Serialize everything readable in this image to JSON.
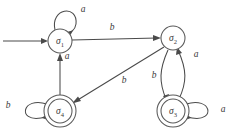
{
  "diagram": {
    "type": "finite-state-automaton",
    "title": "",
    "stroke_color": "#4a4a4a",
    "label_color": "#3a3a3a",
    "background": "#ffffff",
    "alphabet": [
      "a",
      "b"
    ],
    "states": [
      {
        "id": "s1",
        "label": "σ",
        "subscript": "1",
        "x": 60,
        "y": 41,
        "radius": 12,
        "accepting": false,
        "initial": true
      },
      {
        "id": "s2",
        "label": "σ",
        "subscript": "2",
        "x": 173,
        "y": 38,
        "radius": 12,
        "accepting": false,
        "initial": false
      },
      {
        "id": "s3",
        "label": "σ",
        "subscript": "3",
        "x": 173,
        "y": 111,
        "radius": 12,
        "accepting": true,
        "initial": false
      },
      {
        "id": "s4",
        "label": "σ",
        "subscript": "4",
        "x": 60,
        "y": 111,
        "radius": 12,
        "accepting": true,
        "initial": false
      }
    ],
    "transitions": [
      {
        "id": "t-start",
        "from": "",
        "to": "s1",
        "symbol": "",
        "kind": "initial-arrow"
      },
      {
        "id": "t-s1-s1",
        "from": "s1",
        "to": "s1",
        "symbol": "a",
        "kind": "self-loop",
        "label_x": 83,
        "label_y": 10
      },
      {
        "id": "t-s1-s2",
        "from": "s1",
        "to": "s2",
        "symbol": "b",
        "kind": "straight",
        "label_x": 112,
        "label_y": 28
      },
      {
        "id": "t-s2-s4",
        "from": "s2",
        "to": "s4",
        "symbol": "b",
        "kind": "straight",
        "label_x": 124,
        "label_y": 81
      },
      {
        "id": "t-s4-s1",
        "from": "s4",
        "to": "s1",
        "symbol": "a",
        "kind": "straight",
        "label_x": 67,
        "label_y": 57
      },
      {
        "id": "t-s4-s4",
        "from": "s4",
        "to": "s4",
        "symbol": "b",
        "kind": "self-loop",
        "label_x": 8,
        "label_y": 106
      },
      {
        "id": "t-s2-s3",
        "from": "s2",
        "to": "s3",
        "symbol": "b",
        "kind": "curve",
        "label_x": 154,
        "label_y": 76
      },
      {
        "id": "t-s3-s2",
        "from": "s3",
        "to": "s2",
        "symbol": "a",
        "kind": "curve",
        "label_x": 196,
        "label_y": 55
      },
      {
        "id": "t-s3-s3",
        "from": "s3",
        "to": "s3",
        "symbol": "a",
        "kind": "self-loop",
        "label_x": 223,
        "label_y": 110
      }
    ]
  }
}
